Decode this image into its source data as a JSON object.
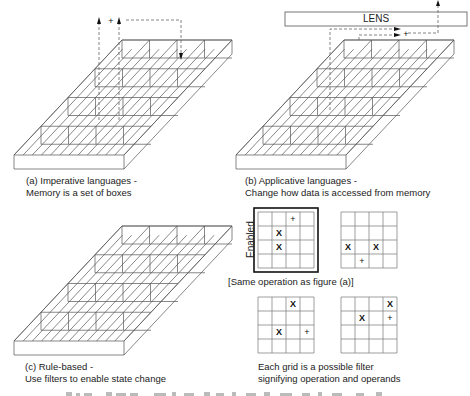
{
  "panels": {
    "a": {
      "label": "(a) Imperative languages -",
      "sublabel": "Memory is a set of boxes",
      "operator": "+"
    },
    "b": {
      "label": "(b) Applicative languages -",
      "sublabel": "Change how data is accessed from memory",
      "lens": "LENS",
      "operator": "+"
    },
    "c": {
      "label": "(c) Rule-based -",
      "sublabel": "Use filters to enable state change"
    }
  },
  "filters": {
    "enabled_label": "Enabled",
    "same_op_note": "[Same operation as figure (a)]",
    "caption_line1": "Each grid is a possible filter",
    "caption_line2": "signifying operation and operands",
    "grids": [
      {
        "name": "grid-1",
        "enabled": true,
        "cells": [
          [
            "",
            "",
            "+",
            ""
          ],
          [
            "",
            "X",
            "",
            ""
          ],
          [
            "",
            "X",
            "",
            ""
          ],
          [
            "",
            "",
            "",
            ""
          ]
        ]
      },
      {
        "name": "grid-2",
        "enabled": false,
        "cells": [
          [
            "",
            "",
            "",
            ""
          ],
          [
            "",
            "",
            "",
            ""
          ],
          [
            "X",
            "",
            "X",
            ""
          ],
          [
            "",
            "+",
            "",
            ""
          ]
        ]
      },
      {
        "name": "grid-3",
        "enabled": false,
        "cells": [
          [
            "",
            "",
            "X",
            ""
          ],
          [
            "",
            "",
            "",
            ""
          ],
          [
            "",
            "X",
            "",
            "+"
          ],
          [
            "",
            "",
            "",
            ""
          ]
        ]
      },
      {
        "name": "grid-4",
        "enabled": false,
        "cells": [
          [
            "",
            "",
            "",
            "X"
          ],
          [
            "",
            "X",
            "",
            "+"
          ],
          [
            "",
            "",
            "",
            ""
          ],
          [
            "",
            "",
            "",
            ""
          ]
        ]
      }
    ]
  },
  "colors": {
    "line": "#555555",
    "dash": "#666666",
    "border": "#111111"
  }
}
